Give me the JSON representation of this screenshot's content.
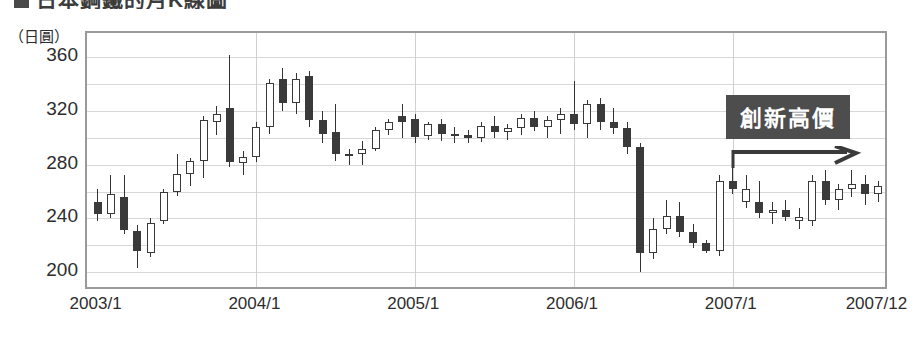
{
  "heading": {
    "marker": "",
    "text": "日本鋼鐵的月K線圖"
  },
  "axis": {
    "unit_label": "（日圓）",
    "y_ticks": [
      {
        "label": "360",
        "value": 360
      },
      {
        "label": "320",
        "value": 320
      },
      {
        "label": "280",
        "value": 280
      },
      {
        "label": "240",
        "value": 240
      },
      {
        "label": "200",
        "value": 200
      }
    ],
    "x_ticks": [
      {
        "label": "2003/1",
        "index": 0
      },
      {
        "label": "2004/1",
        "index": 12
      },
      {
        "label": "2005/1",
        "index": 24
      },
      {
        "label": "2006/1",
        "index": 36
      },
      {
        "label": "2007/1",
        "index": 48
      },
      {
        "label": "2007/12",
        "index": 59
      }
    ]
  },
  "annotation": {
    "label": "創新高價",
    "arrow_icon": "right-arrow-icon"
  },
  "colors": {
    "up_body": "#ffffff",
    "down_body": "#3a3a3a",
    "outline": "#3a3a3a",
    "grid": "#d8d8d8",
    "frame": "#9a9a9a",
    "annotation_bg": "#4d4d4d"
  },
  "chart_data": {
    "type": "candlestick",
    "title": "日本鋼鐵的月K線圖",
    "xlabel": "",
    "ylabel": "（日圓）",
    "ylim": [
      186,
      378
    ],
    "xlim": [
      0,
      60
    ],
    "grid": true,
    "legend": "none",
    "x_start": "2003/1",
    "x_end": "2007/12",
    "series_name": "月K線",
    "ohlc": [
      {
        "t": "2003/1",
        "o": 252,
        "h": 262,
        "l": 238,
        "c": 243,
        "dir": "down"
      },
      {
        "t": "2003/2",
        "o": 243,
        "h": 272,
        "l": 240,
        "c": 258,
        "dir": "up"
      },
      {
        "t": "2003/3",
        "o": 256,
        "h": 272,
        "l": 228,
        "c": 231,
        "dir": "down"
      },
      {
        "t": "2003/4",
        "o": 231,
        "h": 235,
        "l": 203,
        "c": 216,
        "dir": "down"
      },
      {
        "t": "2003/5",
        "o": 214,
        "h": 240,
        "l": 211,
        "c": 237,
        "dir": "up"
      },
      {
        "t": "2003/6",
        "o": 238,
        "h": 262,
        "l": 236,
        "c": 260,
        "dir": "up"
      },
      {
        "t": "2003/7",
        "o": 260,
        "h": 288,
        "l": 257,
        "c": 273,
        "dir": "up"
      },
      {
        "t": "2003/8",
        "o": 273,
        "h": 285,
        "l": 264,
        "c": 283,
        "dir": "up"
      },
      {
        "t": "2003/9",
        "o": 283,
        "h": 316,
        "l": 270,
        "c": 313,
        "dir": "up"
      },
      {
        "t": "2003/10",
        "o": 312,
        "h": 324,
        "l": 302,
        "c": 318,
        "dir": "up"
      },
      {
        "t": "2003/11",
        "o": 322,
        "h": 362,
        "l": 278,
        "c": 282,
        "dir": "down"
      },
      {
        "t": "2003/12",
        "o": 281,
        "h": 290,
        "l": 272,
        "c": 286,
        "dir": "up"
      },
      {
        "t": "2004/1",
        "o": 286,
        "h": 312,
        "l": 282,
        "c": 308,
        "dir": "up"
      },
      {
        "t": "2004/2",
        "o": 308,
        "h": 344,
        "l": 303,
        "c": 341,
        "dir": "up"
      },
      {
        "t": "2004/3",
        "o": 344,
        "h": 352,
        "l": 320,
        "c": 326,
        "dir": "down"
      },
      {
        "t": "2004/4",
        "o": 326,
        "h": 348,
        "l": 318,
        "c": 344,
        "dir": "up"
      },
      {
        "t": "2004/5",
        "o": 346,
        "h": 350,
        "l": 308,
        "c": 313,
        "dir": "down"
      },
      {
        "t": "2004/6",
        "o": 313,
        "h": 320,
        "l": 296,
        "c": 303,
        "dir": "down"
      },
      {
        "t": "2004/7",
        "o": 304,
        "h": 325,
        "l": 283,
        "c": 288,
        "dir": "down"
      },
      {
        "t": "2004/8",
        "o": 288,
        "h": 292,
        "l": 280,
        "c": 288,
        "dir": "up"
      },
      {
        "t": "2004/9",
        "o": 288,
        "h": 298,
        "l": 280,
        "c": 292,
        "dir": "up"
      },
      {
        "t": "2004/10",
        "o": 292,
        "h": 308,
        "l": 290,
        "c": 306,
        "dir": "up"
      },
      {
        "t": "2004/11",
        "o": 306,
        "h": 314,
        "l": 302,
        "c": 312,
        "dir": "up"
      },
      {
        "t": "2004/12",
        "o": 312,
        "h": 325,
        "l": 300,
        "c": 316,
        "dir": "down"
      },
      {
        "t": "2005/1",
        "o": 314,
        "h": 318,
        "l": 296,
        "c": 301,
        "dir": "down"
      },
      {
        "t": "2005/2",
        "o": 301,
        "h": 312,
        "l": 298,
        "c": 310,
        "dir": "up"
      },
      {
        "t": "2005/3",
        "o": 310,
        "h": 314,
        "l": 298,
        "c": 303,
        "dir": "down"
      },
      {
        "t": "2005/4",
        "o": 303,
        "h": 308,
        "l": 296,
        "c": 302,
        "dir": "up"
      },
      {
        "t": "2005/5",
        "o": 302,
        "h": 306,
        "l": 296,
        "c": 300,
        "dir": "down"
      },
      {
        "t": "2005/6",
        "o": 300,
        "h": 312,
        "l": 297,
        "c": 309,
        "dir": "up"
      },
      {
        "t": "2005/7",
        "o": 309,
        "h": 316,
        "l": 300,
        "c": 304,
        "dir": "down"
      },
      {
        "t": "2005/8",
        "o": 304,
        "h": 310,
        "l": 298,
        "c": 307,
        "dir": "up"
      },
      {
        "t": "2005/9",
        "o": 307,
        "h": 318,
        "l": 302,
        "c": 315,
        "dir": "up"
      },
      {
        "t": "2005/10",
        "o": 315,
        "h": 320,
        "l": 305,
        "c": 308,
        "dir": "down"
      },
      {
        "t": "2005/11",
        "o": 308,
        "h": 316,
        "l": 300,
        "c": 313,
        "dir": "up"
      },
      {
        "t": "2005/12",
        "o": 313,
        "h": 322,
        "l": 303,
        "c": 318,
        "dir": "up"
      },
      {
        "t": "2006/1",
        "o": 318,
        "h": 342,
        "l": 306,
        "c": 310,
        "dir": "down"
      },
      {
        "t": "2006/2",
        "o": 310,
        "h": 328,
        "l": 300,
        "c": 325,
        "dir": "up"
      },
      {
        "t": "2006/3",
        "o": 325,
        "h": 330,
        "l": 306,
        "c": 312,
        "dir": "down"
      },
      {
        "t": "2006/4",
        "o": 312,
        "h": 322,
        "l": 303,
        "c": 307,
        "dir": "down"
      },
      {
        "t": "2006/5",
        "o": 307,
        "h": 312,
        "l": 288,
        "c": 293,
        "dir": "down"
      },
      {
        "t": "2006/6",
        "o": 293,
        "h": 296,
        "l": 200,
        "c": 214,
        "dir": "down"
      },
      {
        "t": "2006/7",
        "o": 214,
        "h": 240,
        "l": 210,
        "c": 232,
        "dir": "up"
      },
      {
        "t": "2006/8",
        "o": 232,
        "h": 254,
        "l": 228,
        "c": 242,
        "dir": "up"
      },
      {
        "t": "2006/9",
        "o": 242,
        "h": 252,
        "l": 226,
        "c": 230,
        "dir": "down"
      },
      {
        "t": "2006/10",
        "o": 230,
        "h": 236,
        "l": 218,
        "c": 222,
        "dir": "down"
      },
      {
        "t": "2006/11",
        "o": 222,
        "h": 224,
        "l": 214,
        "c": 216,
        "dir": "down"
      },
      {
        "t": "2006/12",
        "o": 216,
        "h": 272,
        "l": 212,
        "c": 268,
        "dir": "up"
      },
      {
        "t": "2007/1",
        "o": 268,
        "h": 280,
        "l": 258,
        "c": 262,
        "dir": "down"
      },
      {
        "t": "2007/2",
        "o": 262,
        "h": 272,
        "l": 248,
        "c": 252,
        "dir": "up"
      },
      {
        "t": "2007/3",
        "o": 252,
        "h": 268,
        "l": 240,
        "c": 244,
        "dir": "down"
      },
      {
        "t": "2007/4",
        "o": 244,
        "h": 252,
        "l": 236,
        "c": 246,
        "dir": "up"
      },
      {
        "t": "2007/5",
        "o": 246,
        "h": 254,
        "l": 238,
        "c": 241,
        "dir": "down"
      },
      {
        "t": "2007/6",
        "o": 241,
        "h": 248,
        "l": 232,
        "c": 238,
        "dir": "up"
      },
      {
        "t": "2007/7",
        "o": 238,
        "h": 272,
        "l": 234,
        "c": 268,
        "dir": "up"
      },
      {
        "t": "2007/8",
        "o": 268,
        "h": 276,
        "l": 250,
        "c": 254,
        "dir": "down"
      },
      {
        "t": "2007/9",
        "o": 254,
        "h": 266,
        "l": 246,
        "c": 262,
        "dir": "up"
      },
      {
        "t": "2007/10",
        "o": 262,
        "h": 276,
        "l": 256,
        "c": 266,
        "dir": "up"
      },
      {
        "t": "2007/11",
        "o": 266,
        "h": 272,
        "l": 250,
        "c": 258,
        "dir": "down"
      },
      {
        "t": "2007/12",
        "o": 258,
        "h": 268,
        "l": 252,
        "c": 264,
        "dir": "up"
      }
    ]
  }
}
